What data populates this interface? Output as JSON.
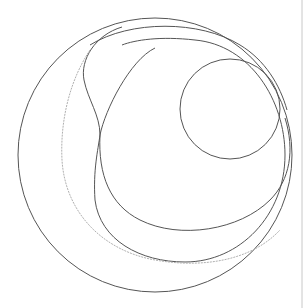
{
  "diagram": {
    "type": "nested-circles",
    "stroke": "#555555",
    "dashed_stroke": "#b0b0b0",
    "edge_line_color": "#c8c8c8",
    "shapes": [
      {
        "name": "outer-circle",
        "cx": 155,
        "cy": 155,
        "r": 137
      },
      {
        "name": "inner-small-circle",
        "cx": 230,
        "cy": 109,
        "r": 50
      }
    ]
  }
}
